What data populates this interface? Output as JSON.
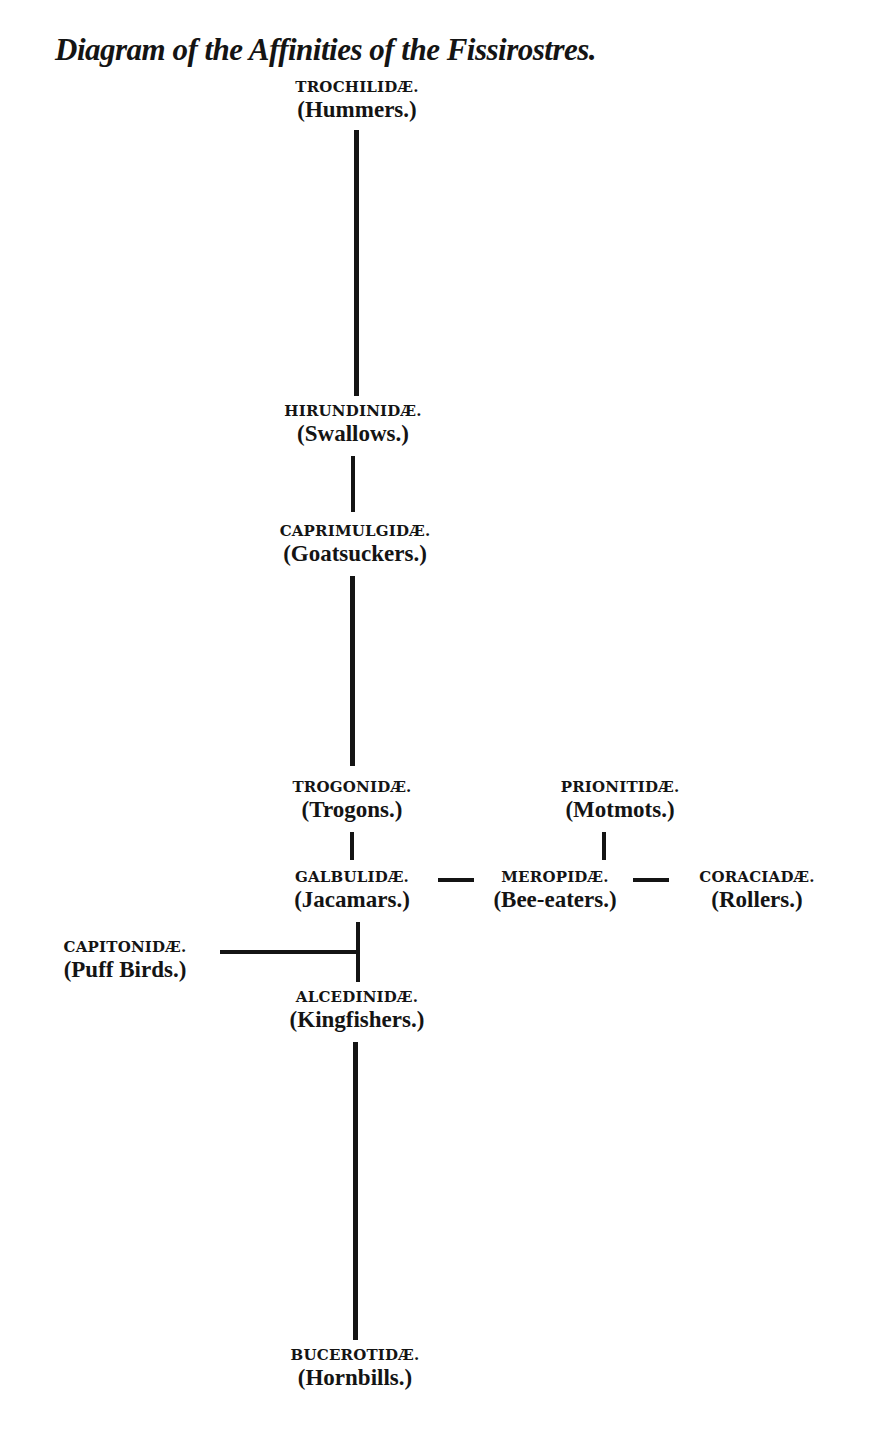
{
  "title": "Diagram of the Affinities of the Fissirostres.",
  "nodes": {
    "trochilidae": {
      "family": "TROCHILIDÆ.",
      "common": "(Hummers.)"
    },
    "hirundinidae": {
      "family": "HIRUNDINIDÆ.",
      "common": "(Swallows.)"
    },
    "caprimulgidae": {
      "family": "CAPRIMULGIDÆ.",
      "common": "(Goatsuckers.)"
    },
    "trogonidae": {
      "family": "TROGONIDÆ.",
      "common": "(Trogons.)"
    },
    "prionitidae": {
      "family": "PRIONITIDÆ.",
      "common": "(Motmots.)"
    },
    "galbulidae": {
      "family": "GALBULIDÆ.",
      "common": "(Jacamars.)"
    },
    "meropidae": {
      "family": "MEROPIDÆ.",
      "common": "(Bee-eaters.)"
    },
    "coraciadae": {
      "family": "CORACIADÆ.",
      "common": "(Rollers.)"
    },
    "capitonidae": {
      "family": "CAPITONIDÆ.",
      "common": "(Puff Birds.)"
    },
    "alcedinidae": {
      "family": "ALCEDINIDÆ.",
      "common": "(Kingfishers.)"
    },
    "bucerotidae": {
      "family": "BUCEROTIDÆ.",
      "common": "(Hornbills.)"
    }
  },
  "edges": [
    [
      "trochilidae",
      "hirundinidae"
    ],
    [
      "hirundinidae",
      "caprimulgidae"
    ],
    [
      "caprimulgidae",
      "trogonidae"
    ],
    [
      "trogonidae",
      "galbulidae"
    ],
    [
      "prionitidae",
      "meropidae"
    ],
    [
      "galbulidae",
      "meropidae"
    ],
    [
      "meropidae",
      "coraciadae"
    ],
    [
      "galbulidae",
      "alcedinidae"
    ],
    [
      "capitonidae",
      "galbulidae-alcedinidae-link"
    ],
    [
      "alcedinidae",
      "bucerotidae"
    ]
  ],
  "caption": ""
}
